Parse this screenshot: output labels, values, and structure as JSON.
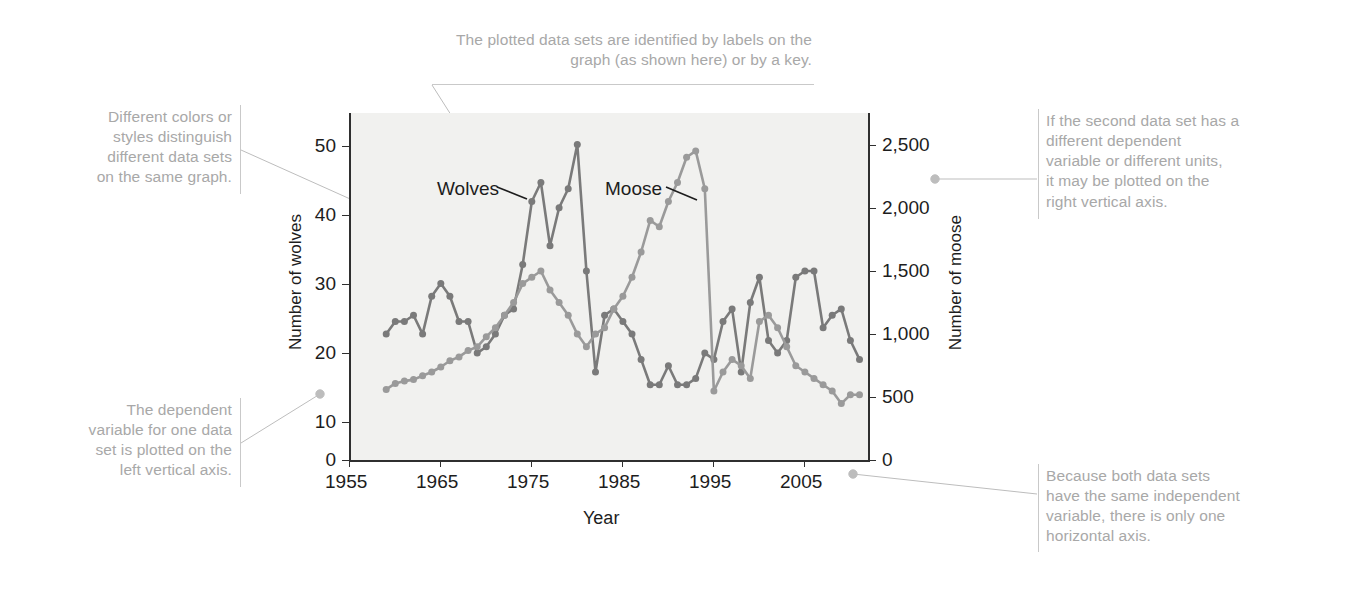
{
  "annotations": {
    "top": "The plotted data sets are identified by labels on the\ngraph (as shown here) or by a key.",
    "left_top": "Different colors or\nstyles distinguish\ndifferent data sets\non the same graph.",
    "left_bottom": "The dependent\nvariable for one data\nset is plotted on the\nleft vertical axis.",
    "right_top": "If the second data set has a\ndifferent dependent\nvariable or different units,\nit may be plotted on the\nright vertical axis.",
    "right_bottom": "Because both data sets\nhave the same independent\nvariable, there is only one\nhorizontal axis."
  },
  "chart_data": {
    "type": "line",
    "title": "",
    "xlabel": "Year",
    "ylabel": "Number of wolves",
    "y2label": "Number of moose",
    "xlim": [
      1955,
      2012
    ],
    "ylim": [
      0,
      55
    ],
    "y2lim": [
      0,
      2750
    ],
    "xticks": [
      "1955",
      "1965",
      "1975",
      "1985",
      "1995",
      "2005"
    ],
    "xtick_values": [
      1955,
      1965,
      1975,
      1985,
      1995,
      2005
    ],
    "yticks": [
      "0",
      "10",
      "20",
      "30",
      "40",
      "50"
    ],
    "ytick_values": [
      0,
      10,
      20,
      30,
      40,
      50
    ],
    "y2ticks": [
      "0",
      "500",
      "1,000",
      "1,500",
      "2,000",
      "2,500"
    ],
    "y2tick_values": [
      0,
      500,
      1000,
      1500,
      2000,
      2500
    ],
    "grid": false,
    "legend": "inline-labels",
    "colors": {
      "wolves": "#7a7a7a",
      "moose": "#9a9a9a",
      "plot_bg": "#f1f1ef",
      "axis": "#2f2f2f",
      "annotation": "#a8a8a8"
    },
    "series": [
      {
        "name": "Wolves",
        "axis": "left",
        "label_x": 1966.5,
        "label_y": 45.5,
        "x": [
          1959,
          1960,
          1961,
          1962,
          1963,
          1964,
          1965,
          1966,
          1967,
          1968,
          1969,
          1970,
          1971,
          1972,
          1973,
          1974,
          1975,
          1976,
          1977,
          1978,
          1979,
          1980,
          1981,
          1982,
          1983,
          1984,
          1985,
          1986,
          1987,
          1988,
          1989,
          1990,
          1991,
          1992,
          1993,
          1994,
          1995,
          1996,
          1997,
          1998,
          1999,
          2000,
          2001,
          2002,
          2003,
          2004,
          2005,
          2006,
          2007,
          2008,
          2009,
          2010,
          2011
        ],
        "values": [
          20,
          22,
          22,
          23,
          20,
          26,
          28,
          26,
          22,
          22,
          17,
          18,
          20,
          23,
          24,
          31,
          41,
          44,
          34,
          40,
          43,
          50,
          30,
          14,
          23,
          24,
          22,
          20,
          16,
          12,
          12,
          15,
          12,
          12,
          13,
          17,
          16,
          22,
          24,
          14,
          25,
          29,
          19,
          17,
          19,
          29,
          30,
          30,
          21,
          23,
          24,
          19,
          16
        ]
      },
      {
        "name": "Moose",
        "axis": "right",
        "label_x": 1983.5,
        "label_y": 2275,
        "x": [
          1959,
          1960,
          1961,
          1962,
          1963,
          1964,
          1965,
          1966,
          1967,
          1968,
          1969,
          1970,
          1971,
          1972,
          1973,
          1974,
          1975,
          1976,
          1977,
          1978,
          1979,
          1980,
          1981,
          1982,
          1983,
          1984,
          1985,
          1986,
          1987,
          1988,
          1989,
          1990,
          1991,
          1992,
          1993,
          1994,
          1995,
          1996,
          1997,
          1998,
          1999,
          2000,
          2001,
          2002,
          2003,
          2004,
          2005,
          2006,
          2007,
          2008,
          2009,
          2010,
          2011
        ],
        "values": [
          563,
          610,
          628,
          640,
          670,
          700,
          740,
          790,
          820,
          870,
          900,
          980,
          1050,
          1150,
          1250,
          1400,
          1450,
          1500,
          1350,
          1250,
          1150,
          1000,
          900,
          1000,
          1050,
          1200,
          1300,
          1450,
          1650,
          1900,
          1850,
          2050,
          2200,
          2400,
          2450,
          2150,
          550,
          700,
          800,
          750,
          650,
          1100,
          1150,
          1050,
          900,
          750,
          700,
          650,
          600,
          550,
          450,
          520,
          520
        ]
      }
    ]
  }
}
